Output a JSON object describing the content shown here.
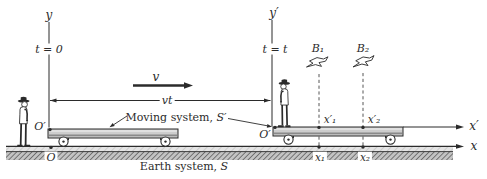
{
  "axes": {
    "y": "y",
    "y_prime": "y′",
    "x": "x",
    "x_prime": "x′"
  },
  "time_labels": {
    "initial": "t = 0",
    "current": "t = t"
  },
  "motion": {
    "velocity": "v",
    "displacement": "vt"
  },
  "frames": {
    "moving": {
      "name": "Moving system, ",
      "symbol": "S′"
    },
    "earth": {
      "name": "Earth system, ",
      "symbol": "S"
    }
  },
  "origins": {
    "moving_initial": "O′",
    "moving_current": "O′",
    "earth": "O"
  },
  "birds": {
    "b1": "B₁",
    "b2": "B₂"
  },
  "positions": {
    "x1_prime": "x′₁",
    "x2_prime": "x′₂",
    "x1": "x₁",
    "x2": "x₂"
  },
  "colors": {
    "ink": "#2b2b2b",
    "background": "#ffffff",
    "cart_fill": "#cdcdcd",
    "ground_light": "#e4e4e4",
    "ground_dark": "#bfbfbf"
  }
}
